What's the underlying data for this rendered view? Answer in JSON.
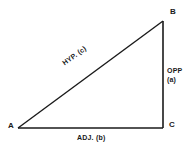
{
  "diagram": {
    "type": "right-triangle",
    "background_color": "#ffffff",
    "line_color": "#1a1a1a",
    "vertices": [
      {
        "id": "a",
        "label": "A",
        "x": 18,
        "y": 128,
        "position": "bottom-left"
      },
      {
        "id": "b",
        "label": "B",
        "x": 163,
        "y": 21,
        "position": "top-right"
      },
      {
        "id": "c",
        "label": "C",
        "x": 163,
        "y": 128,
        "position": "bottom-right",
        "right_angle": true
      }
    ],
    "sides": {
      "hypotenuse": {
        "label": "HYP. (c)",
        "from": "A",
        "to": "B",
        "rotation_deg": -35.5
      },
      "opposite": {
        "label_line1": "OPP",
        "label_line2": "(a)",
        "from": "B",
        "to": "C"
      },
      "adjacent": {
        "label": "ADJ. (b)",
        "from": "A",
        "to": "C"
      }
    }
  }
}
